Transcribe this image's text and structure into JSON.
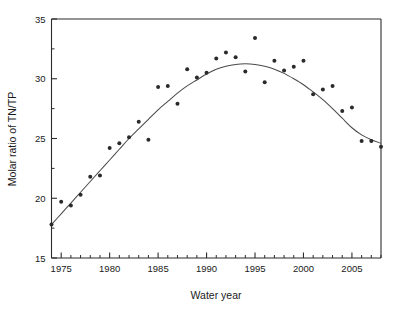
{
  "chart_data": {
    "type": "scatter",
    "title": "",
    "subtitle": "",
    "xlabel": "Water year",
    "ylabel": "Molar ratio of TN/TP",
    "xlim": [
      1974,
      2008
    ],
    "ylim": [
      15,
      35
    ],
    "grid": false,
    "legend": null,
    "x_major_ticks": [
      1975,
      1980,
      1985,
      1990,
      1995,
      2000,
      2005
    ],
    "x_major_tick_labels": [
      "1975",
      "1980",
      "1985",
      "1990",
      "1995",
      "2000",
      "2005"
    ],
    "x_minor_tick_interval": 1,
    "y_major_ticks": [
      15,
      20,
      25,
      30,
      35
    ],
    "y_major_tick_labels": [
      "15",
      "20",
      "25",
      "30",
      "35"
    ],
    "y_minor_ticks": [
      17.5,
      22.5,
      27.5,
      32.5
    ],
    "x": [
      1974,
      1975,
      1976,
      1977,
      1978,
      1979,
      1980,
      1981,
      1982,
      1983,
      1984,
      1985,
      1986,
      1987,
      1988,
      1989,
      1990,
      1991,
      1992,
      1993,
      1994,
      1995,
      1996,
      1997,
      1998,
      1999,
      2000,
      2001,
      2002,
      2003,
      2004,
      2005,
      2006,
      2007,
      2008
    ],
    "values": [
      17.8,
      19.7,
      19.4,
      20.3,
      21.8,
      21.9,
      24.2,
      24.6,
      25.1,
      26.4,
      24.9,
      29.3,
      29.4,
      27.9,
      30.8,
      30.1,
      30.5,
      31.7,
      32.2,
      31.8,
      30.6,
      33.4,
      29.7,
      31.5,
      30.7,
      31.0,
      31.5,
      28.7,
      29.1,
      29.4,
      27.3,
      27.6,
      24.8,
      24.8,
      24.3
    ],
    "series": [
      {
        "name": "Molar ratio of TN/TP",
        "type": "scatter",
        "marker": "circle",
        "color": "#2a2a2a",
        "values": [
          17.8,
          19.7,
          19.4,
          20.3,
          21.8,
          21.9,
          24.2,
          24.6,
          25.1,
          26.4,
          24.9,
          29.3,
          29.4,
          27.9,
          30.8,
          30.1,
          30.5,
          31.7,
          32.2,
          31.8,
          30.6,
          33.4,
          29.7,
          31.5,
          30.7,
          31.0,
          31.5,
          28.7,
          29.1,
          29.4,
          27.3,
          27.6,
          24.8,
          24.8,
          24.3
        ]
      },
      {
        "name": "fitted trend curve",
        "type": "line",
        "color": "#4a4a4a",
        "x": [
          1974,
          1975,
          1976,
          1977,
          1978,
          1979,
          1980,
          1981,
          1982,
          1983,
          1984,
          1985,
          1986,
          1987,
          1988,
          1989,
          1990,
          1991,
          1992,
          1993,
          1994,
          1995,
          1996,
          1997,
          1998,
          1999,
          2000,
          2001,
          2002,
          2003,
          2004,
          2005,
          2006,
          2007,
          2008
        ],
        "values": [
          17.8,
          18.7,
          19.6,
          20.5,
          21.4,
          22.3,
          23.2,
          24.1,
          25.0,
          25.8,
          26.6,
          27.4,
          28.1,
          28.8,
          29.4,
          29.9,
          30.4,
          30.8,
          31.05,
          31.2,
          31.25,
          31.2,
          31.05,
          30.8,
          30.45,
          30.0,
          29.5,
          28.9,
          28.25,
          27.5,
          26.7,
          25.9,
          25.3,
          24.9,
          24.6
        ]
      }
    ]
  },
  "axes": {
    "x_title": "Water year",
    "y_title": "Molar ratio of TN/TP"
  }
}
